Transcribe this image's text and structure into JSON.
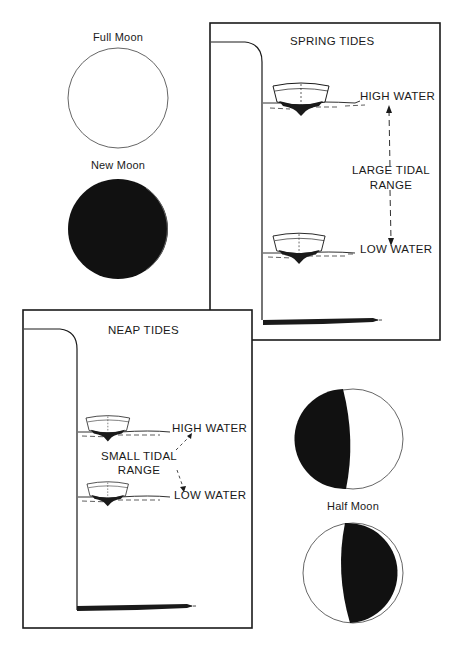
{
  "moons": {
    "full": {
      "label": "Full Moon"
    },
    "new": {
      "label": "New Moon"
    },
    "half": {
      "label": "Half Moon"
    }
  },
  "spring_panel": {
    "title": "SPRING TIDES",
    "high_label": "HIGH WATER",
    "low_label": "LOW WATER",
    "range_line1": "LARGE TIDAL",
    "range_line2": "RANGE"
  },
  "neap_panel": {
    "title": "NEAP TIDES",
    "high_label": "HIGH WATER",
    "low_label": "LOW WATER",
    "range_line1": "SMALL TIDAL",
    "range_line2": "RANGE"
  },
  "colors": {
    "ink": "#1a1a1a",
    "paper": "#ffffff"
  }
}
